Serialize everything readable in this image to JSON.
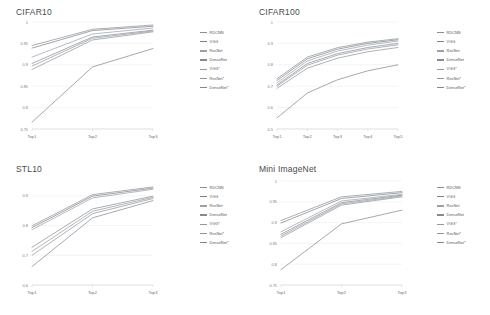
{
  "figure": {
    "panels": [
      {
        "id": "cifar10",
        "title": "CIFAR10",
        "legend_position": "right",
        "chart_data": {
          "type": "line",
          "title": "CIFAR10",
          "xlabel": "",
          "ylabel": "",
          "grid": true,
          "categories": [
            "Top1",
            "Top2",
            "Top3"
          ],
          "ylim": [
            0.75,
            1.0
          ],
          "yticks": [
            0.75,
            0.8,
            0.85,
            0.9,
            0.95,
            1
          ],
          "ytick_labels": [
            "0.75",
            "0.8",
            "0.85",
            "0.9",
            "0.95",
            "1"
          ],
          "series": [
            {
              "name": "RDCNN",
              "color": "#8a8f96",
              "values": [
                0.945,
                0.983,
                0.993
              ]
            },
            {
              "name": "VGG",
              "color": "#7c8189",
              "values": [
                0.939,
                0.98,
                0.99
              ]
            },
            {
              "name": "ResNet",
              "color": "#9aa0a6",
              "values": [
                0.918,
                0.972,
                0.986
              ]
            },
            {
              "name": "DenseNet",
              "color": "#868b92",
              "values": [
                0.903,
                0.965,
                0.981
              ]
            },
            {
              "name": "VGG*",
              "color": "#9499a0",
              "values": [
                0.897,
                0.962,
                0.979
              ]
            },
            {
              "name": "ResNet*",
              "color": "#8f949b",
              "values": [
                0.889,
                0.958,
                0.977
              ]
            },
            {
              "name": "DenseNet*",
              "color": "#82878e",
              "values": [
                0.766,
                0.895,
                0.938
              ]
            }
          ]
        }
      },
      {
        "id": "cifar100",
        "title": "CIFAR100",
        "legend_position": "right",
        "chart_data": {
          "type": "line",
          "title": "CIFAR100",
          "xlabel": "",
          "ylabel": "",
          "grid": true,
          "categories": [
            "Top1",
            "Top2",
            "Top3",
            "Top4",
            "Top5"
          ],
          "ylim": [
            0.5,
            1.0
          ],
          "yticks": [
            0.5,
            0.6,
            0.7,
            0.8,
            0.9,
            1
          ],
          "ytick_labels": [
            "0.5",
            "0.6",
            "0.7",
            "0.8",
            "0.9",
            "1"
          ],
          "series": [
            {
              "name": "RDCNN",
              "color": "#8a8f96",
              "values": [
                0.735,
                0.836,
                0.88,
                0.906,
                0.922
              ]
            },
            {
              "name": "VGG",
              "color": "#7c8189",
              "values": [
                0.727,
                0.828,
                0.873,
                0.9,
                0.917
              ]
            },
            {
              "name": "ResNet",
              "color": "#9aa0a6",
              "values": [
                0.716,
                0.818,
                0.864,
                0.892,
                0.911
              ]
            },
            {
              "name": "DenseNet",
              "color": "#868b92",
              "values": [
                0.706,
                0.806,
                0.852,
                0.881,
                0.9
              ]
            },
            {
              "name": "VGG*",
              "color": "#9499a0",
              "values": [
                0.7,
                0.798,
                0.845,
                0.874,
                0.893
              ]
            },
            {
              "name": "ResNet*",
              "color": "#8f949b",
              "values": [
                0.69,
                0.784,
                0.831,
                0.861,
                0.881
              ]
            },
            {
              "name": "DenseNet*",
              "color": "#82878e",
              "values": [
                0.552,
                0.668,
                0.73,
                0.772,
                0.8
              ]
            }
          ]
        }
      },
      {
        "id": "stl10",
        "title": "STL10",
        "legend_position": "right",
        "chart_data": {
          "type": "line",
          "title": "STL10",
          "xlabel": "",
          "ylabel": "",
          "grid": true,
          "categories": [
            "Top1",
            "Top2",
            "Top3"
          ],
          "ylim": [
            0.6,
            0.95
          ],
          "yticks": [
            0.6,
            0.7,
            0.8,
            0.9
          ],
          "ytick_labels": [
            "0.6",
            "0.7",
            "0.8",
            "0.9"
          ],
          "series": [
            {
              "name": "RDCNN",
              "color": "#8a8f96",
              "values": [
                0.799,
                0.904,
                0.93
              ]
            },
            {
              "name": "VGG",
              "color": "#7c8189",
              "values": [
                0.793,
                0.899,
                0.926
              ]
            },
            {
              "name": "ResNet",
              "color": "#9aa0a6",
              "values": [
                0.786,
                0.893,
                0.922
              ]
            },
            {
              "name": "DenseNet",
              "color": "#868b92",
              "values": [
                0.727,
                0.856,
                0.899
              ]
            },
            {
              "name": "VGG*",
              "color": "#9499a0",
              "values": [
                0.713,
                0.848,
                0.895
              ]
            },
            {
              "name": "ResNet*",
              "color": "#8f949b",
              "values": [
                0.7,
                0.84,
                0.891
              ]
            },
            {
              "name": "DenseNet*",
              "color": "#82878e",
              "values": [
                0.662,
                0.826,
                0.884
              ]
            }
          ]
        }
      },
      {
        "id": "mini-imagenet",
        "title": "Mini ImageNet",
        "legend_position": "right",
        "chart_data": {
          "type": "line",
          "title": "Mini ImageNet",
          "xlabel": "",
          "ylabel": "",
          "grid": true,
          "categories": [
            "Top1",
            "Top2",
            "Top3"
          ],
          "ylim": [
            0.75,
            1.0
          ],
          "yticks": [
            0.75,
            0.8,
            0.85,
            0.9,
            0.95,
            1
          ],
          "ytick_labels": [
            "0.75",
            "0.8",
            "0.85",
            "0.9",
            "0.95",
            "1"
          ],
          "series": [
            {
              "name": "RDCNN",
              "color": "#8a8f96",
              "values": [
                0.905,
                0.962,
                0.975
              ]
            },
            {
              "name": "VGG",
              "color": "#7c8189",
              "values": [
                0.899,
                0.958,
                0.972
              ]
            },
            {
              "name": "ResNet",
              "color": "#9aa0a6",
              "values": [
                0.878,
                0.952,
                0.968
              ]
            },
            {
              "name": "DenseNet",
              "color": "#868b92",
              "values": [
                0.872,
                0.948,
                0.966
              ]
            },
            {
              "name": "VGG*",
              "color": "#9499a0",
              "values": [
                0.868,
                0.945,
                0.964
              ]
            },
            {
              "name": "ResNet*",
              "color": "#8f949b",
              "values": [
                0.864,
                0.942,
                0.962
              ]
            },
            {
              "name": "DenseNet*",
              "color": "#82878e",
              "values": [
                0.787,
                0.897,
                0.93
              ]
            }
          ]
        }
      }
    ]
  }
}
